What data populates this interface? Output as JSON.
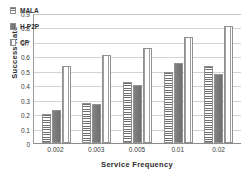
{
  "chart_data": {
    "type": "bar",
    "title": "",
    "xlabel": "Service Frequency",
    "ylabel": "Success Rate",
    "categories": [
      "0.002",
      "0.003",
      "0.005",
      "0.01",
      "0.02"
    ],
    "series": [
      {
        "name": "MALA",
        "values": [
          0.2,
          0.28,
          0.42,
          0.49,
          0.53
        ]
      },
      {
        "name": "H-P2P",
        "values": [
          0.23,
          0.27,
          0.4,
          0.555,
          0.475
        ]
      },
      {
        "name": "CF",
        "values": [
          0.53,
          0.61,
          0.655,
          0.735,
          0.81
        ]
      }
    ],
    "ylim": [
      0,
      0.9
    ],
    "yticks": [
      "0.9",
      "0.8",
      "0.7",
      "0.6",
      "0.5",
      "0.4",
      "0.3",
      "0.2",
      "0.1",
      "0"
    ],
    "ytick_values": [
      0.9,
      0.8,
      0.7,
      0.6,
      0.5,
      0.4,
      0.3,
      0.2,
      0.1,
      0.0
    ],
    "grid": true,
    "legend_position": "top-left",
    "legend": [
      {
        "label": "MALA",
        "pattern": "horizontal-stripes"
      },
      {
        "label": "H-P2P",
        "pattern": "solid-gray"
      },
      {
        "label": "CF",
        "pattern": "vertical-stripes"
      }
    ]
  }
}
